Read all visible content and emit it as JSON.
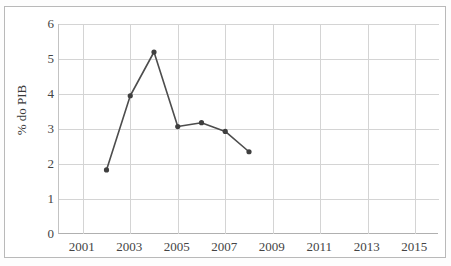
{
  "chart_data": {
    "type": "line",
    "title": "",
    "subtitle": "",
    "xlabel": "",
    "ylabel": "% do PIB",
    "x": [
      2002,
      2003,
      2004,
      2005,
      2006,
      2007,
      2008
    ],
    "values": [
      1.83,
      3.95,
      5.2,
      3.07,
      3.18,
      2.93,
      2.35
    ],
    "series": [
      {
        "name": "% do PIB",
        "x": [
          2002,
          2003,
          2004,
          2005,
          2006,
          2007,
          2008
        ],
        "values": [
          1.83,
          3.95,
          5.2,
          3.07,
          3.18,
          2.93,
          2.35
        ]
      }
    ],
    "xlim": [
      2000,
      2016
    ],
    "ylim": [
      0,
      6
    ],
    "x_ticks": [
      2001,
      2003,
      2005,
      2007,
      2009,
      2011,
      2013,
      2015
    ],
    "x_tick_labels": [
      "2001",
      "2003",
      "2005",
      "2007",
      "2009",
      "2011",
      "2013",
      "2015"
    ],
    "y_ticks": [
      0,
      1,
      2,
      3,
      4,
      5,
      6
    ],
    "y_tick_labels": [
      "0",
      "1",
      "2",
      "3",
      "4",
      "5",
      "6"
    ],
    "grid": true,
    "grid_axis": "both",
    "legend": false,
    "legend_position": "none",
    "marker": "circle",
    "line_color": "#4d4d4d",
    "marker_color": "#3f3f3f",
    "grid_color": "#d4d4d4",
    "axis_color": "#b0b0b0",
    "background_color": "#ffffff",
    "annotations": []
  },
  "axis": {
    "y_title": "% do PIB"
  }
}
